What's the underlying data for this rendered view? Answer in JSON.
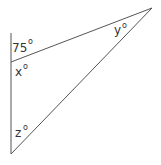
{
  "diagram": {
    "type": "triangle-angle-problem",
    "line_color": "#555555",
    "vertices": {
      "top_left": {
        "x": 11,
        "y": 62
      },
      "top_right": {
        "x": 152,
        "y": 8
      },
      "bottom": {
        "x": 11,
        "y": 154
      }
    },
    "extension_top": {
      "x": 11,
      "y": 33
    },
    "labels": {
      "exterior_angle": {
        "value": "75",
        "degree": "o"
      },
      "angle_x": {
        "value": "x",
        "degree": "o"
      },
      "angle_y": {
        "value": "y",
        "degree": "o"
      },
      "angle_z": {
        "value": "z",
        "degree": "o"
      }
    }
  }
}
